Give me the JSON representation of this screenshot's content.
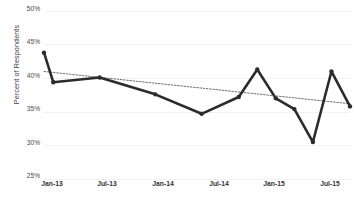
{
  "chart_data": {
    "type": "line",
    "title": "",
    "xlabel": "",
    "ylabel": "Percent of Respondents",
    "ylim": [
      25,
      50
    ],
    "ytick_labels": [
      "50%",
      "45%",
      "40%",
      "35%",
      "30%",
      "25%"
    ],
    "ytick_values": [
      50,
      45,
      40,
      35,
      30,
      25
    ],
    "xtick_labels": [
      "Jan-13",
      "Jul-13",
      "Jan-14",
      "Jul-14",
      "Jan-15",
      "Jul-15"
    ],
    "xtick_values": [
      0,
      6,
      12,
      18,
      24,
      30
    ],
    "grid": true,
    "legend": "none",
    "series": [
      {
        "name": "Percent of Respondents",
        "marker": "circle",
        "color": "#2b2b2b",
        "x": [
          0,
          1,
          6,
          12,
          17,
          21,
          23,
          25,
          27,
          29,
          31,
          33
        ],
        "values": [
          43.8,
          39.4,
          40.1,
          37.6,
          34.7,
          37.2,
          41.3,
          37.0,
          35.4,
          30.5,
          41.0,
          35.8
        ]
      },
      {
        "name": "Linear trendline",
        "style": "dotted",
        "color": "#6e6e6e",
        "x": [
          0,
          33
        ],
        "values": [
          41.0,
          36.2
        ]
      }
    ]
  },
  "axes": {
    "y_title": "Percent of Respondents"
  }
}
